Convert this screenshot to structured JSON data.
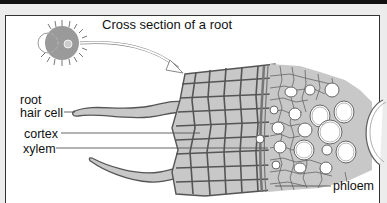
{
  "diagram": {
    "title": "Cross section of a root",
    "labels": {
      "root": "root",
      "hair_cell": "hair cell",
      "cortex": "cortex",
      "xylem": "xylem",
      "phloem": "phloem"
    },
    "colors": {
      "cell_fill": "#c8c8c8",
      "cell_wall": "#555555",
      "root_cross_section": "#9a9a9a",
      "frame_border": "#333333",
      "background": "#ffffff"
    }
  }
}
